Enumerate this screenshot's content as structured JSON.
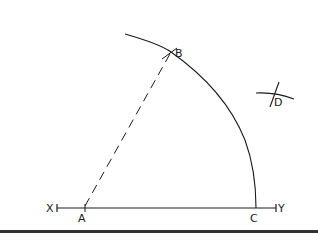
{
  "diagram": {
    "type": "geometric-construction",
    "stroke_color": "#1a1a1a",
    "background": "#ffffff",
    "labels": {
      "x": "X",
      "y": "Y",
      "a": "A",
      "b": "B",
      "c": "C",
      "d": "D"
    },
    "points": {
      "A": [
        85,
        208
      ],
      "B": [
        171,
        52
      ],
      "C": [
        256,
        208
      ],
      "D": [
        275,
        96
      ]
    },
    "elements": [
      {
        "kind": "line",
        "name": "baseline XY",
        "from": "X",
        "to": "Y"
      },
      {
        "kind": "arc",
        "name": "arc through B and C",
        "center": "A"
      },
      {
        "kind": "dashed-line",
        "name": "AB",
        "from": "A",
        "to": "B"
      },
      {
        "kind": "intersection-marks",
        "name": "D construction arcs",
        "at": "D"
      }
    ]
  }
}
